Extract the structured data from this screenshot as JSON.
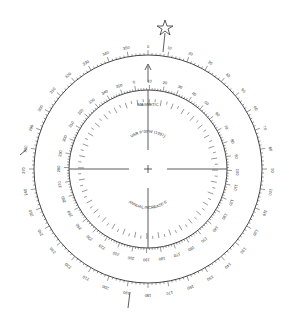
{
  "diagram": {
    "inner_label_top": "MAGNETIC",
    "variation_text": "VAR 9°00'W (1997)",
    "annual_text": "ANNUAL INCREASE 6'",
    "outer_ring": {
      "type": "true",
      "labels": [
        "0",
        "30",
        "60",
        "90",
        "120",
        "150",
        "180",
        "210",
        "240",
        "270",
        "300",
        "330"
      ]
    },
    "inner_ring": {
      "type": "magnetic"
    },
    "colors": {
      "ink": "#333333",
      "background": "#ffffff"
    }
  }
}
